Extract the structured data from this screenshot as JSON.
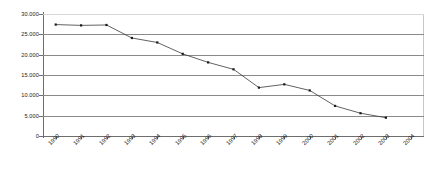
{
  "chart_data": {
    "type": "line",
    "title": "",
    "subtitle": "",
    "xlabel": "",
    "ylabel": "",
    "categories": [
      "1990",
      "1991",
      "1992",
      "1993",
      "1994",
      "1995",
      "1996",
      "1997",
      "1998",
      "1999",
      "2000",
      "2001",
      "2002",
      "2003",
      "2004"
    ],
    "values": [
      27400,
      27200,
      27300,
      24100,
      23000,
      20200,
      18100,
      16400,
      11900,
      12700,
      11200,
      7400,
      5600,
      4500,
      null
    ],
    "series": [
      {
        "name": "",
        "values": [
          27400,
          27200,
          27300,
          24100,
          23000,
          20200,
          18100,
          16400,
          11900,
          12700,
          11200,
          7400,
          5600,
          4500,
          null
        ]
      }
    ],
    "ylim": [
      0,
      30000
    ],
    "ytick_values": [
      0,
      5000,
      10000,
      15000,
      20000,
      25000,
      30000
    ],
    "ytick_labels": [
      "0",
      "5.000",
      "10.000",
      "15.000",
      "20.000",
      "25.000",
      "30.000"
    ],
    "xtick_labels": [
      "1990",
      "1991",
      "1992",
      "1993",
      "1994",
      "1995",
      "1996",
      "1997",
      "1998",
      "1999",
      "2000",
      "2001",
      "2002",
      "2003",
      "2004"
    ],
    "grid": true,
    "grid_axis": "y",
    "legend": false,
    "legend_position": "none",
    "markers": true,
    "line_color": "#3a3a3a",
    "marker_color": "#1a1a1a",
    "grid_color": "#8a8a8a",
    "axis_color": "#6e6e6e",
    "background_color": "#ffffff",
    "annotations": []
  }
}
